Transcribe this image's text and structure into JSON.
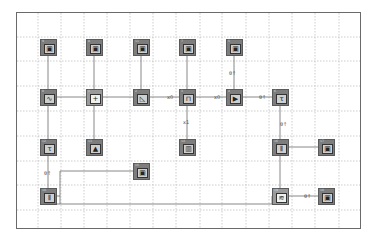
{
  "diagram": {
    "title": "",
    "grid": {
      "cols_x": [
        38,
        61,
        84,
        107,
        130,
        153,
        176,
        200,
        222,
        246,
        269,
        292,
        315,
        339
      ],
      "rows_y": [
        37,
        61,
        86,
        111,
        136,
        161,
        185,
        210
      ]
    },
    "colors": {
      "block": "#7d7d7d",
      "block_light": "#9a9a9a",
      "wire": "#6a6a6a",
      "grid": "#b8b8b8",
      "frame": "#6a6a6a"
    },
    "blocks": [
      {
        "id": "scope1",
        "num": "9",
        "icon": "scope-icon",
        "glyph": "▣",
        "x": 40,
        "y": 39,
        "style": "dark"
      },
      {
        "id": "scope2",
        "num": "8",
        "icon": "scope-icon",
        "glyph": "▣",
        "x": 86,
        "y": 39,
        "style": "dark"
      },
      {
        "id": "scope3",
        "num": "11",
        "icon": "scope-icon",
        "glyph": "▣",
        "x": 133,
        "y": 39,
        "style": "dark"
      },
      {
        "id": "scope4",
        "num": "7",
        "icon": "scope-icon",
        "glyph": "▣",
        "x": 179,
        "y": 39,
        "style": "dark"
      },
      {
        "id": "scope5",
        "num": "5",
        "icon": "scope-icon",
        "glyph": "▣",
        "x": 226,
        "y": 39,
        "style": "dark"
      },
      {
        "id": "source",
        "num": "0",
        "icon": "signal-source-icon",
        "glyph": "∿",
        "x": 40,
        "y": 89,
        "style": "dark"
      },
      {
        "id": "sum",
        "num": "1",
        "icon": "sum-icon",
        "glyph": "+",
        "x": 86,
        "y": 89,
        "style": "light"
      },
      {
        "id": "filter",
        "num": "2",
        "icon": "filter-icon",
        "glyph": "◺",
        "x": 133,
        "y": 89,
        "style": "dark"
      },
      {
        "id": "multiplexer",
        "num": "3",
        "icon": "multiplexer-icon",
        "glyph": "⊓",
        "x": 179,
        "y": 89,
        "style": "dark"
      },
      {
        "id": "player",
        "num": "4",
        "icon": "play-icon",
        "glyph": "▶",
        "x": 226,
        "y": 89,
        "style": "dark"
      },
      {
        "id": "delay1",
        "num": "6",
        "icon": "delay-icon",
        "glyph": "τ",
        "x": 272,
        "y": 89,
        "style": "dark"
      },
      {
        "id": "delay2",
        "num": "12",
        "icon": "delay-icon",
        "glyph": "τ",
        "x": 40,
        "y": 139,
        "style": "dark"
      },
      {
        "id": "noise",
        "num": "13",
        "icon": "noise-icon",
        "glyph": "▲",
        "x": 86,
        "y": 139,
        "style": "dark"
      },
      {
        "id": "bank",
        "num": "14",
        "icon": "bank-icon",
        "glyph": "▥",
        "x": 179,
        "y": 139,
        "style": "dark"
      },
      {
        "id": "demux1",
        "num": "16",
        "icon": "demux-icon",
        "glyph": "⫴",
        "x": 272,
        "y": 139,
        "style": "dark"
      },
      {
        "id": "scope6",
        "num": "17",
        "icon": "scope-icon",
        "glyph": "▣",
        "x": 318,
        "y": 139,
        "style": "dark"
      },
      {
        "id": "scope7",
        "num": "15",
        "icon": "scope-icon",
        "glyph": "▣",
        "x": 133,
        "y": 163,
        "style": "dark"
      },
      {
        "id": "demux2",
        "num": "18",
        "icon": "demux-icon",
        "glyph": "⫴",
        "x": 40,
        "y": 188,
        "style": "dark"
      },
      {
        "id": "correlator",
        "num": "19",
        "icon": "correlator-icon",
        "glyph": "≋",
        "x": 272,
        "y": 188,
        "style": "light"
      },
      {
        "id": "scope8",
        "num": "10",
        "icon": "scope-icon",
        "glyph": "▣",
        "x": 318,
        "y": 188,
        "style": "dark"
      }
    ],
    "labels": [
      {
        "text": "x0",
        "x": 167,
        "y": 94
      },
      {
        "text": "x0",
        "x": 214,
        "y": 94
      },
      {
        "text": "θ↑",
        "x": 259,
        "y": 94
      },
      {
        "text": "θ↑",
        "x": 229,
        "y": 70
      },
      {
        "text": "x1",
        "x": 183,
        "y": 119
      },
      {
        "text": "θ↑",
        "x": 280,
        "y": 121
      },
      {
        "text": "θ↑",
        "x": 44,
        "y": 170
      },
      {
        "text": "θ↑",
        "x": 304,
        "y": 193
      }
    ]
  }
}
